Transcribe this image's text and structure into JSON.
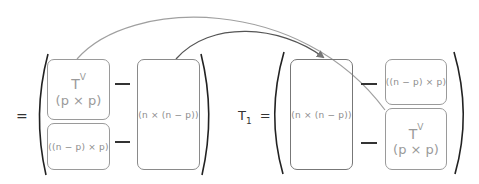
{
  "left_equation": {
    "equals": "=",
    "top_block": {
      "symbol": "T",
      "superscript": "V",
      "dims": "(p × p)"
    },
    "bottom_block": {
      "dims": "((n − p) × p)"
    },
    "right_block": {
      "dims": "(n × (n − p))"
    }
  },
  "right_equation": {
    "label": "T",
    "label_subscript": "1",
    "equals": "=",
    "left_block": {
      "dims": "(n × (n − p))"
    },
    "top_block": {
      "dims": "((n − p) × p)"
    },
    "bottom_block": {
      "symbol": "T",
      "superscript": "V",
      "dims": "(p × p)"
    }
  },
  "arrows": [
    {
      "from": "left-tv-block",
      "to": "right-tv-block",
      "color": "#9a9a9a"
    },
    {
      "from": "left-nxn-p-block",
      "to": "right-nxn-p-block",
      "color": "#555555"
    }
  ]
}
